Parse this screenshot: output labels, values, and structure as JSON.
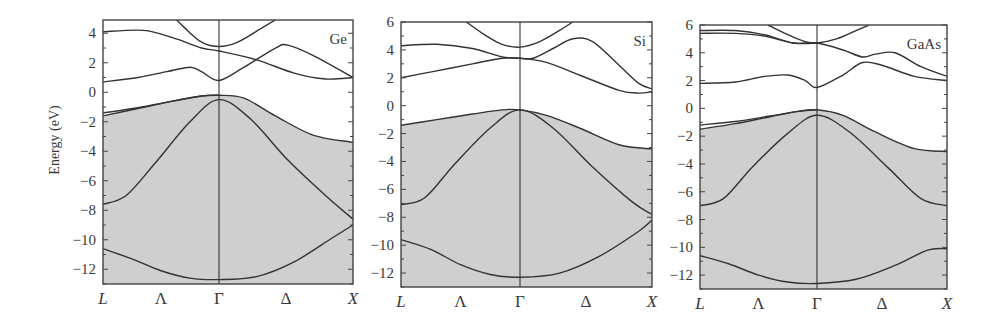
{
  "figure": {
    "ylabel": "Energy (eV)",
    "fill_color": "#cfcfcf",
    "line_color": "#333333"
  },
  "chart_data": [
    {
      "type": "line",
      "title": "Ge",
      "xlabel": "",
      "ylabel": "Energy (eV)",
      "x_tick_labels": [
        "L",
        "Λ",
        "Γ",
        "Δ",
        "X"
      ],
      "y_ticks": [
        4,
        2,
        0,
        -2,
        -4,
        -6,
        -8,
        -10,
        -12
      ],
      "ylim": [
        -13,
        4.9
      ],
      "shaded_region": "valence bands (below top valence band)",
      "x_note": "x: 0 = L, 1 = Γ, 1.15 = X (path L→Γ→X)",
      "series": [
        {
          "name": "band1",
          "points": [
            [
              0,
              -10.6
            ],
            [
              0.25,
              -11.3
            ],
            [
              0.5,
              -12.1
            ],
            [
              0.75,
              -12.6
            ],
            [
              1,
              -12.7
            ],
            [
              1.3,
              -12.5
            ],
            [
              1.6,
              -11.5
            ],
            [
              1.9,
              -9.9
            ],
            [
              2.07,
              -9.0
            ]
          ]
        },
        {
          "name": "band2",
          "points": [
            [
              0,
              -7.6
            ],
            [
              0.2,
              -7.0
            ],
            [
              0.45,
              -4.8
            ],
            [
              0.75,
              -2.0
            ],
            [
              1,
              -0.5
            ],
            [
              1.25,
              -1.8
            ],
            [
              1.55,
              -4.6
            ],
            [
              1.85,
              -7.0
            ],
            [
              2.07,
              -8.6
            ]
          ]
        },
        {
          "name": "band3",
          "points": [
            [
              0,
              -1.6
            ],
            [
              0.3,
              -1.1
            ],
            [
              0.6,
              -0.6
            ],
            [
              0.85,
              -0.25
            ],
            [
              1,
              -0.2
            ],
            [
              1.2,
              -0.4
            ],
            [
              1.45,
              -1.6
            ],
            [
              1.75,
              -2.9
            ],
            [
              2.07,
              -3.4
            ]
          ]
        },
        {
          "name": "band4",
          "points": [
            [
              0,
              -1.4
            ],
            [
              0.3,
              -1.05
            ],
            [
              0.6,
              -0.6
            ],
            [
              0.85,
              -0.25
            ],
            [
              1,
              -0.2
            ]
          ]
        },
        {
          "name": "cond1",
          "points": [
            [
              0,
              0.7
            ],
            [
              0.3,
              1.0
            ],
            [
              0.55,
              1.4
            ],
            [
              0.75,
              1.7
            ],
            [
              0.85,
              1.4
            ],
            [
              1,
              0.8
            ],
            [
              1.2,
              1.7
            ],
            [
              1.45,
              3.0
            ],
            [
              1.55,
              3.2
            ],
            [
              1.75,
              2.5
            ],
            [
              2.07,
              1.0
            ]
          ]
        },
        {
          "name": "cond2",
          "points": [
            [
              0,
              4.1
            ],
            [
              0.35,
              4.2
            ],
            [
              0.6,
              3.7
            ],
            [
              0.85,
              3.0
            ],
            [
              1,
              2.8
            ],
            [
              1.3,
              2.2
            ],
            [
              1.6,
              1.3
            ],
            [
              1.85,
              0.9
            ],
            [
              2.07,
              1.0
            ]
          ]
        },
        {
          "name": "cond3",
          "points": [
            [
              0.6,
              5.2
            ],
            [
              0.7,
              4.4
            ],
            [
              0.85,
              3.4
            ],
            [
              1,
              3.1
            ],
            [
              1.15,
              3.4
            ],
            [
              1.35,
              4.4
            ],
            [
              1.45,
              4.9
            ]
          ]
        }
      ]
    },
    {
      "type": "line",
      "title": "Si",
      "xlabel": "",
      "ylabel": "",
      "x_tick_labels": [
        "L",
        "Λ",
        "Γ",
        "Δ",
        "X"
      ],
      "y_ticks": [
        6,
        4,
        2,
        0,
        -2,
        -4,
        -6,
        -8,
        -10,
        -12
      ],
      "ylim": [
        -13,
        6
      ],
      "shaded_region": "valence bands (below top valence band)",
      "series": [
        {
          "name": "band1",
          "points": [
            [
              0,
              -9.6
            ],
            [
              0.25,
              -10.3
            ],
            [
              0.5,
              -11.4
            ],
            [
              0.75,
              -12.1
            ],
            [
              1,
              -12.3
            ],
            [
              1.3,
              -12.0
            ],
            [
              1.6,
              -10.8
            ],
            [
              1.9,
              -9.0
            ],
            [
              2.0,
              -8.2
            ]
          ]
        },
        {
          "name": "band2",
          "points": [
            [
              0,
              -7.1
            ],
            [
              0.2,
              -6.6
            ],
            [
              0.45,
              -4.2
            ],
            [
              0.75,
              -1.6
            ],
            [
              1,
              -0.3
            ],
            [
              1.25,
              -1.6
            ],
            [
              1.55,
              -4.4
            ],
            [
              1.85,
              -6.9
            ],
            [
              2.0,
              -7.8
            ]
          ]
        },
        {
          "name": "band3",
          "points": [
            [
              0,
              -1.4
            ],
            [
              0.3,
              -1.0
            ],
            [
              0.6,
              -0.6
            ],
            [
              0.85,
              -0.3
            ],
            [
              1,
              -0.3
            ],
            [
              1.2,
              -0.7
            ],
            [
              1.45,
              -1.6
            ],
            [
              1.75,
              -2.8
            ],
            [
              2.0,
              -3.1
            ]
          ]
        },
        {
          "name": "cond1",
          "points": [
            [
              0,
              2.0
            ],
            [
              0.3,
              2.5
            ],
            [
              0.6,
              3.0
            ],
            [
              0.85,
              3.4
            ],
            [
              1,
              3.4
            ],
            [
              1.2,
              3.1
            ],
            [
              1.45,
              2.2
            ],
            [
              1.75,
              1.1
            ],
            [
              1.9,
              0.9
            ],
            [
              2.0,
              1.0
            ]
          ]
        },
        {
          "name": "cond2",
          "points": [
            [
              0,
              4.3
            ],
            [
              0.3,
              4.4
            ],
            [
              0.6,
              4.1
            ],
            [
              0.85,
              3.5
            ],
            [
              1,
              3.4
            ],
            [
              1.1,
              3.4
            ],
            [
              1.25,
              4.1
            ],
            [
              1.4,
              4.8
            ],
            [
              1.55,
              4.6
            ],
            [
              1.75,
              2.9
            ],
            [
              1.9,
              1.6
            ],
            [
              2.0,
              1.2
            ]
          ]
        },
        {
          "name": "cond3",
          "points": [
            [
              0.55,
              6.0
            ],
            [
              0.7,
              5.1
            ],
            [
              0.85,
              4.4
            ],
            [
              1,
              4.2
            ],
            [
              1.15,
              4.6
            ],
            [
              1.3,
              5.4
            ],
            [
              1.4,
              6.0
            ]
          ]
        }
      ]
    },
    {
      "type": "line",
      "title": "GaAs",
      "xlabel": "",
      "ylabel": "",
      "x_tick_labels": [
        "L",
        "Λ",
        "Γ",
        "Δ",
        "X"
      ],
      "y_ticks": [
        6,
        4,
        2,
        0,
        -2,
        -4,
        -6,
        -8,
        -10,
        -12
      ],
      "ylim": [
        -13,
        6
      ],
      "shaded_region": "valence bands (below top valence band)",
      "series": [
        {
          "name": "band1",
          "points": [
            [
              0,
              -10.6
            ],
            [
              0.25,
              -11.2
            ],
            [
              0.5,
              -12.0
            ],
            [
              0.75,
              -12.5
            ],
            [
              1,
              -12.6
            ],
            [
              1.3,
              -12.3
            ],
            [
              1.6,
              -11.3
            ],
            [
              1.85,
              -10.2
            ],
            [
              2.0,
              -10.1
            ]
          ]
        },
        {
          "name": "band2",
          "points": [
            [
              0,
              -7.0
            ],
            [
              0.2,
              -6.5
            ],
            [
              0.45,
              -4.2
            ],
            [
              0.75,
              -1.8
            ],
            [
              1,
              -0.5
            ],
            [
              1.25,
              -1.7
            ],
            [
              1.55,
              -4.3
            ],
            [
              1.8,
              -6.5
            ],
            [
              2.0,
              -7.0
            ]
          ]
        },
        {
          "name": "band3",
          "points": [
            [
              0,
              -1.5
            ],
            [
              0.3,
              -1.1
            ],
            [
              0.6,
              -0.6
            ],
            [
              0.85,
              -0.2
            ],
            [
              1,
              -0.1
            ],
            [
              1.2,
              -0.5
            ],
            [
              1.45,
              -1.7
            ],
            [
              1.75,
              -2.9
            ],
            [
              2.0,
              -3.1
            ]
          ]
        },
        {
          "name": "band4",
          "points": [
            [
              0,
              -1.2
            ],
            [
              0.3,
              -0.95
            ],
            [
              0.6,
              -0.55
            ],
            [
              0.85,
              -0.2
            ],
            [
              1,
              -0.1
            ]
          ]
        },
        {
          "name": "cond1",
          "points": [
            [
              0,
              1.8
            ],
            [
              0.3,
              1.9
            ],
            [
              0.55,
              2.3
            ],
            [
              0.75,
              2.4
            ],
            [
              0.9,
              2.0
            ],
            [
              1,
              1.5
            ],
            [
              1.2,
              2.4
            ],
            [
              1.35,
              3.3
            ],
            [
              1.5,
              3.1
            ],
            [
              1.75,
              2.3
            ],
            [
              2.0,
              2.0
            ]
          ]
        },
        {
          "name": "cond2",
          "points": [
            [
              0,
              5.4
            ],
            [
              0.3,
              5.4
            ],
            [
              0.55,
              5.2
            ],
            [
              0.8,
              4.7
            ],
            [
              1,
              4.7
            ],
            [
              1.2,
              4.2
            ],
            [
              1.35,
              3.7
            ],
            [
              1.45,
              3.9
            ],
            [
              1.6,
              4.0
            ],
            [
              1.8,
              3.0
            ],
            [
              2.0,
              2.3
            ]
          ]
        },
        {
          "name": "cond3",
          "points": [
            [
              0,
              5.6
            ],
            [
              0.3,
              5.6
            ],
            [
              0.55,
              5.3
            ],
            [
              0.8,
              4.7
            ],
            [
              1,
              4.7
            ]
          ]
        },
        {
          "name": "cond4",
          "points": [
            [
              0.58,
              6.0
            ],
            [
              0.75,
              5.3
            ],
            [
              0.9,
              4.8
            ],
            [
              1,
              4.7
            ],
            [
              1.15,
              5.0
            ],
            [
              1.3,
              5.6
            ],
            [
              1.4,
              6.0
            ]
          ]
        }
      ]
    }
  ],
  "panels": [
    {
      "frame": {
        "left": 103,
        "right": 353,
        "top": 20,
        "bottom": 284
      },
      "gamma_x": 219,
      "ymax": 4.9,
      "ymin": -13,
      "xmax": 2.07
    },
    {
      "frame": {
        "left": 401,
        "right": 652,
        "top": 22,
        "bottom": 287
      },
      "gamma_x": 520,
      "ymax": 6,
      "ymin": -13,
      "xmax": 2.0
    },
    {
      "frame": {
        "left": 700,
        "right": 947,
        "top": 25,
        "bottom": 289
      },
      "gamma_x": 817,
      "ymax": 6,
      "ymin": -13,
      "xmax": 2.0
    }
  ]
}
